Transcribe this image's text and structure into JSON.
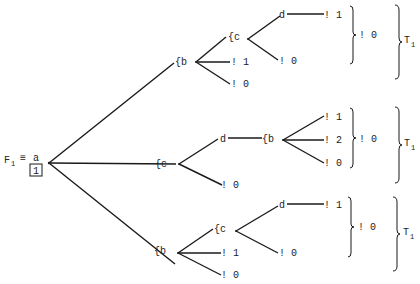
{
  "diagram": {
    "root": {
      "label": "F",
      "subscript": "1",
      "equiv": "≡",
      "node": "a",
      "boxed": "1"
    },
    "subtrees": [
      {
        "nodes": {
          "b": "{b",
          "c": "{c",
          "d": "d"
        },
        "leaves": {
          "d_out": "! 1",
          "c_out": "! 0",
          "b_mid": "! 1",
          "b_low": "! 0"
        },
        "inner_result": "! 0",
        "tree_label": "T",
        "tree_sub": "1"
      },
      {
        "nodes": {
          "c": "{c",
          "d": "d",
          "b": "{b"
        },
        "leaves": {
          "b_top": "! 1",
          "b_mid": "! 2",
          "b_low": "! 0",
          "c_out": "! 0"
        },
        "inner_result": "! 0",
        "tree_label": "T",
        "tree_sub": "1"
      },
      {
        "nodes": {
          "b": "{b",
          "c": "{c",
          "d": "d"
        },
        "leaves": {
          "d_out": "! 1",
          "c_out": "! 0",
          "b_mid": "! 1",
          "b_low": "! 0"
        },
        "inner_result": "! 0",
        "tree_label": "T",
        "tree_sub": "1"
      }
    ]
  }
}
